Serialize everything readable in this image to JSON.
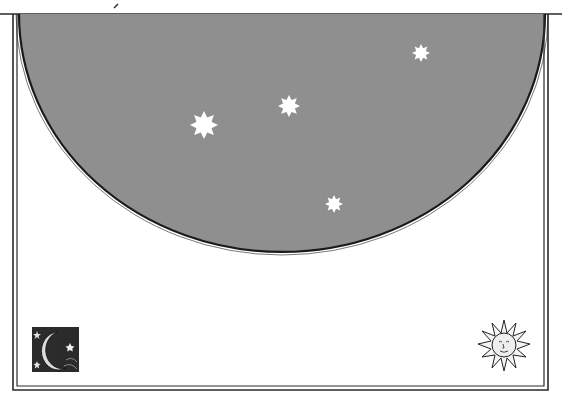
{
  "page": {
    "background": "#ffffff"
  },
  "frame": {
    "line_color": "#2a2a2a",
    "outer": {
      "x": 13,
      "y": 14,
      "right": 548,
      "bottom": 390
    },
    "inner": {
      "x": 17,
      "right": 544,
      "bottom": 386
    }
  },
  "sky": {
    "fill": "#8f8f8f",
    "edge_color": "#1a1a1a",
    "left_x": 19,
    "right_x": 545,
    "top_y": 14,
    "bottom_y": 252
  },
  "stars": [
    {
      "name": "star-large",
      "cx": 204,
      "cy": 125,
      "r": 14
    },
    {
      "name": "star-medium",
      "cx": 289,
      "cy": 106,
      "r": 11
    },
    {
      "name": "star-upper-right",
      "cx": 421,
      "cy": 53,
      "r": 9
    },
    {
      "name": "star-lower",
      "cx": 334,
      "cy": 204,
      "r": 9
    }
  ],
  "ornaments": {
    "moon": {
      "label": "moon-woodcut",
      "x": 32,
      "y": 327,
      "w": 47,
      "h": 45
    },
    "sun": {
      "label": "sun-woodcut",
      "cx": 504,
      "cy": 345,
      "r": 25
    }
  }
}
